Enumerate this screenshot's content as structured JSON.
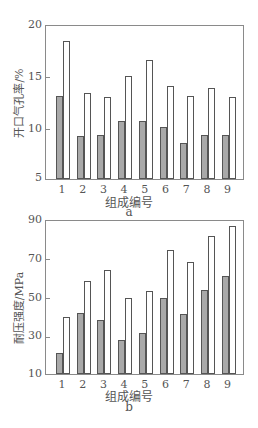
{
  "chart_data": [
    {
      "type": "bar",
      "panel": "a",
      "title": "",
      "xlabel": "组成编号",
      "ylabel": "开口气孔率/%",
      "categories": [
        "1",
        "2",
        "3",
        "4",
        "5",
        "6",
        "7",
        "8",
        "9"
      ],
      "series": [
        {
          "name": "gray",
          "color": "#a9a9a9",
          "values": [
            13.1,
            9.2,
            9.3,
            10.7,
            10.7,
            10.1,
            8.5,
            9.3,
            9.3
          ]
        },
        {
          "name": "white",
          "color": "#ffffff",
          "values": [
            18.5,
            13.4,
            13.0,
            15.1,
            16.7,
            14.1,
            13.1,
            13.9,
            13.0
          ]
        }
      ],
      "ylim": [
        5,
        20
      ],
      "yticks": [
        "20",
        "15",
        "10",
        "5"
      ],
      "grid": false,
      "legend": null
    },
    {
      "type": "bar",
      "panel": "b",
      "title": "",
      "xlabel": "组成编号",
      "ylabel": "耐压强度/MPa",
      "categories": [
        "1",
        "2",
        "3",
        "4",
        "5",
        "6",
        "7",
        "8",
        "9"
      ],
      "series": [
        {
          "name": "gray",
          "color": "#a9a9a9",
          "values": [
            21,
            42,
            38,
            28,
            31.5,
            50,
            41.5,
            54,
            61
          ]
        },
        {
          "name": "white",
          "color": "#ffffff",
          "values": [
            40,
            58.5,
            64.5,
            49.5,
            53.5,
            75,
            68.5,
            82,
            87.5
          ]
        }
      ],
      "ylim": [
        10,
        90
      ],
      "yticks": [
        "90",
        "70",
        "50",
        "30",
        "10"
      ],
      "grid": false,
      "legend": null
    }
  ],
  "panels": {
    "a": {
      "ylabel": "开口气孔率/%",
      "xlabel": "组成编号",
      "caption": "a",
      "yticks": [
        "20",
        "15",
        "10",
        "5"
      ],
      "xticks": [
        "1",
        "2",
        "3",
        "4",
        "5",
        "6",
        "7",
        "8",
        "9"
      ]
    },
    "b": {
      "ylabel": "耐压强度/MPa",
      "xlabel": "组成编号",
      "caption": "b",
      "yticks": [
        "90",
        "70",
        "50",
        "30",
        "10"
      ],
      "xticks": [
        "1",
        "2",
        "3",
        "4",
        "5",
        "6",
        "7",
        "8",
        "9"
      ]
    }
  }
}
